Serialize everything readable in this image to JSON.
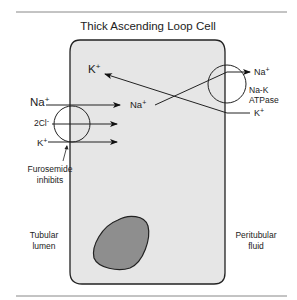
{
  "title": "Thick Ascending Loop Cell",
  "colors": {
    "cell_fill": "#e6e6e6",
    "nucleus_fill": "#8e8e8e",
    "line": "#222222",
    "rule": "#888888"
  },
  "left_transporter": {
    "ions_in": {
      "na": "Na",
      "cl": "2Cl",
      "k": "K"
    },
    "ion_out": "Na",
    "inhibitor_line1": "Furosemide",
    "inhibitor_line2": "inhibits"
  },
  "cell_interior": {
    "k_label": "K"
  },
  "pump": {
    "name_line1": "Na-K",
    "name_line2": "ATPase",
    "na_out": "Na",
    "k_in": "K"
  },
  "charges": {
    "plus": "+",
    "minus": "-"
  },
  "regions": {
    "left_line1": "Tubular",
    "left_line2": "lumen",
    "right_line1": "Peritubular",
    "right_line2": "fluid"
  }
}
